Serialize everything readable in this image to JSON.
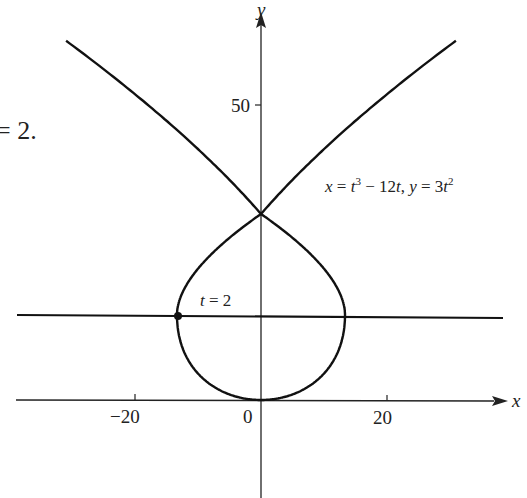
{
  "chart_data": {
    "type": "line",
    "title": "",
    "xlabel": "x",
    "ylabel": "y",
    "x_ticks": [
      -20,
      0,
      20
    ],
    "y_ticks": [
      50
    ],
    "xlim": [
      -40,
      37
    ],
    "ylim": [
      -18,
      68
    ],
    "grid": false,
    "legend": null,
    "series": [
      {
        "name": "parametric curve",
        "equation": "x = t^3 - 12t, y = 3t^2",
        "parameter_range": [
          -4.5,
          4.5
        ],
        "self_intersection": {
          "x": 0,
          "y": 36,
          "t": [
            -3.464,
            3.464
          ]
        }
      },
      {
        "name": "horizontal tangent line",
        "equation": "y = 12",
        "value": 12
      }
    ],
    "points": [
      {
        "label": "t = 2",
        "x": -16,
        "y": 12
      }
    ],
    "annotations": [
      "x = t³ − 12t, y = 3t²",
      "t = 2"
    ]
  },
  "labels": {
    "x_axis": "x",
    "y_axis": "y",
    "tick_neg20": "−20",
    "tick_0": "0",
    "tick_20": "20",
    "tick_50": "50",
    "point_label_t": "t",
    "point_label_rest": " = 2",
    "fragment_text": "= 2."
  },
  "equation_label": {
    "x_part": "x",
    "eq1": " = ",
    "t1": "t",
    "sup3": "3",
    "minus": " − 12",
    "t2": "t",
    "comma": ", ",
    "y_part": "y",
    "eq2": " = 3",
    "t3": "t",
    "sup2": "2"
  },
  "colors": {
    "curve": "#111111",
    "axis": "#222222",
    "background": "#ffffff"
  }
}
